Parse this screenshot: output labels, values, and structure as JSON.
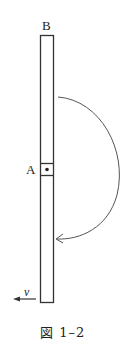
{
  "figure": {
    "caption": "図 1–2",
    "labels": {
      "top_end": "B",
      "point": "A",
      "velocity": "v"
    },
    "elements": {
      "rod": "vertical rod with pivot box at A",
      "pivot": "dot inside square at A",
      "arc": "curved arrow from upper part of rod swinging clockwise to lower part",
      "velocity_arrow": "arrow pointing left at bottom of rod"
    },
    "colors": {
      "stroke": "#333333",
      "background": "#ffffff"
    }
  }
}
